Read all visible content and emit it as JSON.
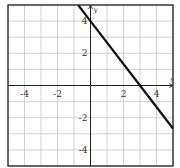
{
  "chart_data": {
    "type": "line",
    "title": "",
    "xlabel": "x",
    "ylabel": "y",
    "xlim": [
      -5,
      5
    ],
    "ylim": [
      -5,
      5
    ],
    "grid": true,
    "grid_step": 1,
    "x_tick_labels": [
      "-4",
      "-2",
      "2",
      "4"
    ],
    "x_ticks": [
      -4,
      -2,
      2,
      4
    ],
    "y_tick_labels": [
      "4",
      "2",
      "-2",
      "-4"
    ],
    "y_ticks": [
      4,
      2,
      -2,
      -4
    ],
    "series": [
      {
        "name": "line",
        "equation": "y = -4/3 x + 4",
        "slope": -1.3333,
        "intercept": 4,
        "x": [
          -0.75,
          0,
          3,
          5
        ],
        "y": [
          5,
          4,
          0,
          -2.67
        ],
        "color": "#111111"
      }
    ],
    "legend": null
  },
  "colors": {
    "grid": "#c8c8c8",
    "axis": "#222222",
    "border": "#222222",
    "line": "#111111"
  }
}
